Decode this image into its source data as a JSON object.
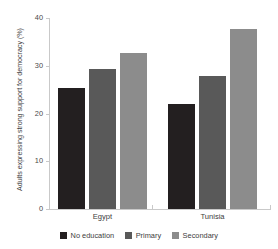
{
  "chart_data": {
    "type": "bar",
    "title": "",
    "xlabel": "",
    "ylabel": "Adults expressing strong support for democracy (%)",
    "categories": [
      "Egypt",
      "Tunisia"
    ],
    "series": [
      {
        "name": "No education",
        "color": "#231f20",
        "values": [
          25.3,
          22.0
        ]
      },
      {
        "name": "Primary",
        "color": "#595959",
        "values": [
          29.3,
          27.8
        ]
      },
      {
        "name": "Secondary",
        "color": "#8c8c8c",
        "values": [
          32.7,
          37.7
        ]
      }
    ],
    "ylim": [
      0,
      40
    ],
    "yticks": [
      0,
      10,
      20,
      30,
      40
    ],
    "ytick_labels": [
      "0",
      "10",
      "20",
      "30",
      "40"
    ],
    "grid": false,
    "legend_position": "bottom"
  },
  "axis": {
    "line_color": "#c9c9c9"
  }
}
